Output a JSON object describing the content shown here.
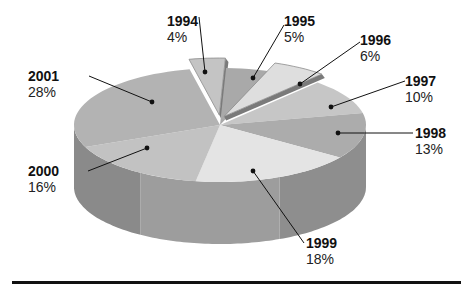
{
  "chart_data": {
    "type": "pie",
    "style": "3d-exploded",
    "title": "",
    "slices": [
      {
        "label": "1994",
        "value": 4,
        "display": "4%",
        "exploded": true
      },
      {
        "label": "1995",
        "value": 5,
        "display": "5%",
        "exploded": false
      },
      {
        "label": "1996",
        "value": 6,
        "display": "6%",
        "exploded": true
      },
      {
        "label": "1997",
        "value": 10,
        "display": "10%",
        "exploded": false
      },
      {
        "label": "1998",
        "value": 13,
        "display": "13%",
        "exploded": false
      },
      {
        "label": "1999",
        "value": 18,
        "display": "18%",
        "exploded": false
      },
      {
        "label": "2000",
        "value": 16,
        "display": "16%",
        "exploded": false
      },
      {
        "label": "2001",
        "value": 28,
        "display": "28%",
        "exploded": false
      }
    ],
    "legend": "none (callout labels)",
    "colors": {
      "1994": "#c4c4c4",
      "1995": "#a9a9a9",
      "1996": "#dedede",
      "1997": "#c6c6c6",
      "1998": "#acacac",
      "1999": "#e4e4e4",
      "2000": "#c2c2c2",
      "2001": "#b3b3b3",
      "wall_front": "#9d9d9d",
      "wall_left": "#8a8a8a",
      "wall_right": "#8e8e8e",
      "rule": "#111111"
    }
  },
  "labels": {
    "l1994": {
      "year": "1994",
      "pct": "4%"
    },
    "l1995": {
      "year": "1995",
      "pct": "5%"
    },
    "l1996": {
      "year": "1996",
      "pct": "6%"
    },
    "l1997": {
      "year": "1997",
      "pct": "10%"
    },
    "l1998": {
      "year": "1998",
      "pct": "13%"
    },
    "l1999": {
      "year": "1999",
      "pct": "18%"
    },
    "l2000": {
      "year": "2000",
      "pct": "16%"
    },
    "l2001": {
      "year": "2001",
      "pct": "28%"
    }
  }
}
